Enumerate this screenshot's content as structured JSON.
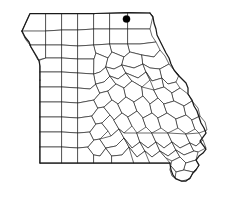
{
  "map": {
    "title": "Missouri county map",
    "state_name": "Missouri",
    "background_color": "#ffffff",
    "county_fill_color": "#ffffff",
    "county_border_color": "#2b2b2b",
    "state_border_color": "#1a1a1a",
    "marker_color": "#000000",
    "marker": {
      "name": "location-marker",
      "shape": "filled-circle",
      "x": 126.5,
      "y": 19.0,
      "radius": 3.6,
      "region": "northeast"
    },
    "view_box": "0 0 226 199",
    "width": 226,
    "height": 199
  },
  "chart_data": {
    "type": "map",
    "subtitle": "",
    "legend": [],
    "annotations": [
      {
        "type": "point-marker",
        "label": "",
        "x": 126.5,
        "y": 19.0,
        "color": "#000000"
      }
    ],
    "features": {
      "state_outline": "Missouri state boundary, with the Missouri River forming the northwest diagonal border, the Mississippi River forming the irregular eastern border, a straight southern border, a straight western border, and the southeastern Bootheel projection",
      "subdivision": "counties",
      "grid": false,
      "axes": false
    },
    "geometry": {
      "state_outline_path": "M 16.5 13.5 L 16.5 13.5 L 30 13.5 L 60 13.5 L 95 13.5 L 128 12.5 L 150 13.0 L 156 18 L 158 25 L 160 32 L 163 38 L 168 45 L 172 52 L 176 58 L 180 63 L 186 66 L 192 70 L 196 76 L 199 82 L 196 86 L 192 88 L 190 93 L 193 98 L 198 103 L 200 109 L 203 115 L 207 121 L 209 127 L 206 132 L 203 137 L 205 142 L 209 147 L 206 152 L 202 155 L 199 158 L 196 161 L 194 166 L 191 171 L 188 176 L 184 180 L 179 181 L 174 180 L 172 175 L 171 169 L 170 163 L 158 163 L 140 163 L 110 163 L 80 163 L 55 163 L 40 163 L 40 140 L 40 110 L 40 80 L 40 66 L 37 62 L 34 57 L 32 51 L 29 46 L 26 41 L 23 36 L 21 30 L 19 24 L 17 18 Z",
      "county_lines_note": "114 counties plus the independent city of St. Louis rendered as interior polylines"
    }
  }
}
